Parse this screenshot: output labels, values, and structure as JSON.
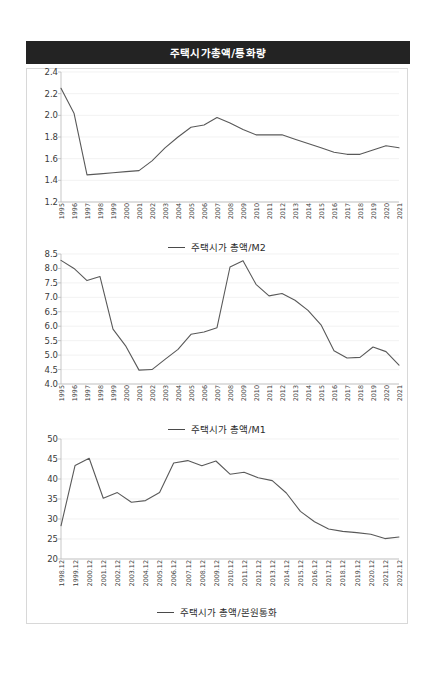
{
  "header": {
    "title": "주택시가총액/통화량",
    "background_color": "#232323",
    "text_color": "#ffffff"
  },
  "panel": {
    "border_color": "#d8d8d8",
    "background_color": "#ffffff"
  },
  "series_color": "#595959",
  "grid_color": "#ededed",
  "chart_data": [
    {
      "type": "line",
      "title": "",
      "xlabel": "",
      "ylabel": "",
      "ylim": [
        1.2,
        2.4
      ],
      "yticks": [
        "1.2",
        "1.4",
        "1.6",
        "1.8",
        "2.0",
        "2.2",
        "2.4"
      ],
      "grid": true,
      "legend": "주택시가 총액/M2",
      "legend_position": "bottom",
      "categories": [
        "1995",
        "1996",
        "1997",
        "1998",
        "1999",
        "2000",
        "2001",
        "2002",
        "2003",
        "2004",
        "2005",
        "2006",
        "2007",
        "2008",
        "2009",
        "2010",
        "2011",
        "2012",
        "2013",
        "2014",
        "2015",
        "2016",
        "2017",
        "2018",
        "2019",
        "2020",
        "2021"
      ],
      "values": [
        2.25,
        2.02,
        1.45,
        1.46,
        1.47,
        1.48,
        1.49,
        1.58,
        1.7,
        1.8,
        1.89,
        1.91,
        1.98,
        1.93,
        1.87,
        1.82,
        1.82,
        1.82,
        1.78,
        1.74,
        1.7,
        1.66,
        1.64,
        1.64,
        1.68,
        1.72,
        1.7
      ]
    },
    {
      "type": "line",
      "title": "",
      "xlabel": "",
      "ylabel": "",
      "ylim": [
        4.0,
        8.5
      ],
      "yticks": [
        "4.0",
        "4.5",
        "5.0",
        "5.5",
        "6.0",
        "6.5",
        "7.0",
        "7.5",
        "8.0",
        "8.5"
      ],
      "grid": true,
      "legend": "주택시가 총액/M1",
      "legend_position": "bottom",
      "categories": [
        "1995",
        "1996",
        "1997",
        "1998",
        "1999",
        "2000",
        "2001",
        "2002",
        "2003",
        "2004",
        "2005",
        "2006",
        "2007",
        "2008",
        "2009",
        "2010",
        "2011",
        "2012",
        "2013",
        "2014",
        "2015",
        "2016",
        "2017",
        "2018",
        "2019",
        "2020",
        "2021"
      ],
      "values": [
        8.28,
        8.0,
        7.58,
        7.72,
        5.9,
        5.3,
        4.48,
        4.5,
        4.85,
        5.2,
        5.72,
        5.8,
        5.95,
        8.05,
        8.27,
        7.45,
        7.05,
        7.13,
        6.9,
        6.55,
        6.05,
        5.15,
        4.9,
        4.92,
        5.28,
        5.12,
        4.65
      ]
    },
    {
      "type": "line",
      "title": "",
      "xlabel": "",
      "ylabel": "",
      "ylim": [
        20,
        50
      ],
      "yticks": [
        "20",
        "25",
        "30",
        "35",
        "40",
        "45",
        "50"
      ],
      "grid": true,
      "legend": "주택시가 총액/본원통화",
      "legend_position": "bottom",
      "categories": [
        "1998.12",
        "1999.12",
        "2000.12",
        "2001.12",
        "2002.12",
        "2003.12",
        "2004.12",
        "2005.12",
        "2006.12",
        "2007.12",
        "2008.12",
        "2009.12",
        "2010.12",
        "2011.12",
        "2012.12",
        "2013.12",
        "2014.12",
        "2015.12",
        "2016.12",
        "2017.12",
        "2018.12",
        "2019.12",
        "2020.12",
        "2021.12",
        "2022.12"
      ],
      "values": [
        28.3,
        43.4,
        45.2,
        35.2,
        36.6,
        34.2,
        34.6,
        36.6,
        44.0,
        44.6,
        43.3,
        44.5,
        41.2,
        41.7,
        40.3,
        39.6,
        36.5,
        31.9,
        29.3,
        27.5,
        26.9,
        26.6,
        26.2,
        25.1,
        25.5
      ]
    }
  ]
}
